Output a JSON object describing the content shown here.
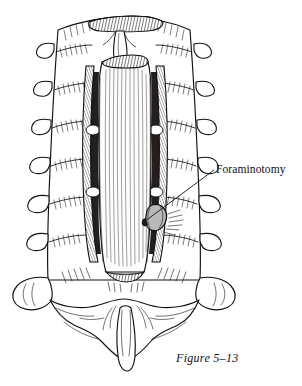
{
  "figure": {
    "caption": "Figure 5–13",
    "annotation_label": "Foraminotomy",
    "background_color": "#ffffff",
    "ink_color": "#111111",
    "shade_color": "#b9b9b9",
    "dark_shade_color": "#2b2b2b"
  },
  "anatomy": {
    "dural_sac": {
      "name": "dural-sac",
      "striation_count": 11
    },
    "left_transverse_processes": 6,
    "right_transverse_processes": 6,
    "sacrum": {
      "name": "sacrum",
      "spinous_process": "median-sacral-crest"
    },
    "foraminotomy_site": {
      "name": "foraminotomy-site",
      "side": "right",
      "leader_line_from": [
        148,
        219
      ],
      "leader_line_to": [
        214,
        170
      ]
    }
  }
}
